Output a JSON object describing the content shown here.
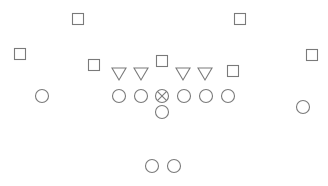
{
  "diagram": {
    "type": "football-formation",
    "stroke_color": "#7a7a7a",
    "background": "#ffffff",
    "defense": {
      "squares": [
        {
          "id": "db-left-deep",
          "x": 78,
          "y": 19
        },
        {
          "id": "db-right-deep",
          "x": 240,
          "y": 19
        },
        {
          "id": "cb-left",
          "x": 20,
          "y": 54
        },
        {
          "id": "lb-left",
          "x": 94,
          "y": 65
        },
        {
          "id": "lb-middle",
          "x": 162,
          "y": 61
        },
        {
          "id": "lb-right",
          "x": 233,
          "y": 71
        },
        {
          "id": "cb-right",
          "x": 312,
          "y": 55
        }
      ],
      "triangles": [
        {
          "id": "dl-1",
          "x": 119,
          "y": 74
        },
        {
          "id": "dl-2",
          "x": 141,
          "y": 74
        },
        {
          "id": "dl-3",
          "x": 183,
          "y": 74
        },
        {
          "id": "dl-4",
          "x": 205,
          "y": 74
        }
      ]
    },
    "offense": {
      "circles": [
        {
          "id": "wr-left",
          "x": 42,
          "y": 96,
          "center": false
        },
        {
          "id": "ol-1",
          "x": 119,
          "y": 96,
          "center": false
        },
        {
          "id": "ol-2",
          "x": 141,
          "y": 96,
          "center": false
        },
        {
          "id": "center",
          "x": 162,
          "y": 96,
          "center": true
        },
        {
          "id": "ol-4",
          "x": 184,
          "y": 96,
          "center": false
        },
        {
          "id": "ol-5",
          "x": 206,
          "y": 96,
          "center": false
        },
        {
          "id": "te",
          "x": 228,
          "y": 96,
          "center": false
        },
        {
          "id": "qb",
          "x": 162,
          "y": 112,
          "center": false
        },
        {
          "id": "wr-right",
          "x": 303,
          "y": 107,
          "center": false
        },
        {
          "id": "rb-left",
          "x": 152,
          "y": 166,
          "center": false
        },
        {
          "id": "rb-right",
          "x": 174,
          "y": 166,
          "center": false
        }
      ]
    }
  }
}
